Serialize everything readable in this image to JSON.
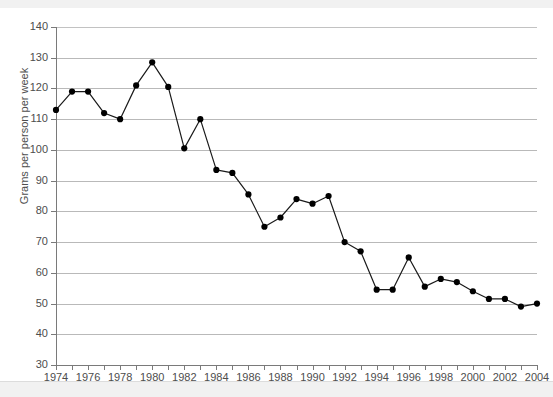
{
  "chart_data": {
    "type": "line",
    "title": "",
    "subtitle": "",
    "xlabel": "",
    "ylabel": "Grams per person per week",
    "xlim": [
      1974,
      2004
    ],
    "ylim": [
      30,
      140
    ],
    "grid": true,
    "legend": false,
    "legend_position": "none",
    "marker": "filled-circle",
    "line_color": "#1a1a1a",
    "marker_color": "#000000",
    "y_ticks": [
      30,
      40,
      50,
      60,
      70,
      80,
      90,
      100,
      110,
      120,
      130,
      140
    ],
    "x_ticks": [
      1974,
      1976,
      1978,
      1980,
      1982,
      1984,
      1986,
      1988,
      1990,
      1992,
      1994,
      1996,
      1998,
      2000,
      2002,
      2004
    ],
    "x_tick_labels": [
      "1974",
      "1976",
      "1978",
      "1980",
      "1982",
      "1984",
      "1986",
      "1988",
      "1990",
      "1992",
      "1994",
      "1996",
      "1998",
      "2000",
      "2002",
      "2004"
    ],
    "y_tick_labels": [
      "30",
      "40",
      "50",
      "60",
      "70",
      "80",
      "90",
      "100",
      "110",
      "120",
      "130",
      "140"
    ],
    "x": [
      1974,
      1975,
      1976,
      1977,
      1978,
      1979,
      1980,
      1981,
      1982,
      1983,
      1984,
      1985,
      1986,
      1987,
      1988,
      1989,
      1990,
      1991,
      1992,
      1993,
      1994,
      1995,
      1996,
      1997,
      1998,
      1999,
      2000,
      2001,
      2002,
      2003,
      2004
    ],
    "values": [
      113,
      119,
      119,
      112,
      110,
      121,
      128.5,
      120.5,
      100.5,
      110,
      93.5,
      92.5,
      85.5,
      75,
      78,
      84,
      82.5,
      85,
      70,
      67,
      54.5,
      54.5,
      65,
      55.5,
      58,
      57,
      54,
      51.5,
      51.5,
      49,
      50
    ],
    "series": [
      {
        "name": "Grams per person per week",
        "values": [
          113,
          119,
          119,
          112,
          110,
          121,
          128.5,
          120.5,
          100.5,
          110,
          93.5,
          92.5,
          85.5,
          75,
          78,
          84,
          82.5,
          85,
          70,
          67,
          54.5,
          54.5,
          65,
          55.5,
          58,
          57,
          54,
          51.5,
          51.5,
          49,
          50
        ]
      }
    ],
    "annotations": []
  },
  "page": {
    "background_color": "#ffffff",
    "band_color": "#f1f1f1",
    "grid_color": "#b9b9b9",
    "axis_color": "#7a7a7a",
    "text_color": "#4d4d4d"
  }
}
